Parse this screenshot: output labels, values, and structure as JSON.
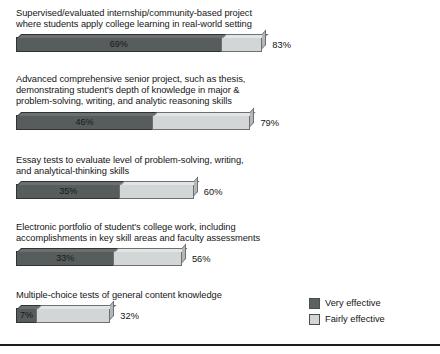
{
  "chart_data": {
    "type": "bar",
    "title": "",
    "subtitle": "",
    "xlabel": "",
    "ylabel": "",
    "orientation": "horizontal",
    "stacked": true,
    "grid": false,
    "xlim": [
      0,
      100
    ],
    "legend_position": "bottom-right",
    "categories": [
      "Supervised/evaluated internship/community-based project where students apply college learning in real-world setting",
      "Advanced comprehensive senior project, such as thesis, demonstrating student's depth of knowledge in major & problem-solving, writing, and analytic reasoning skills",
      "Essay tests to evaluate level of problem-solving, writing, and analytical-thinking skills",
      "Electronic portfolio of student's college work, including accomplishments in key skill areas and faculty assessments",
      "Multiple-choice tests of general content knowledge"
    ],
    "series": [
      {
        "name": "Very effective",
        "color": "#5c6161",
        "values": [
          69,
          46,
          35,
          33,
          7
        ]
      },
      {
        "name": "Fairly effective",
        "color": "#d3d6d6",
        "values": [
          14,
          33,
          25,
          23,
          25
        ]
      }
    ],
    "totals": [
      83,
      79,
      60,
      56,
      32
    ],
    "value_labels": [
      "69%",
      "46%",
      "35%",
      "33%",
      "7%"
    ],
    "total_labels": [
      "83%",
      "79%",
      "60%",
      "56%",
      "32%"
    ]
  },
  "bars": [
    {
      "caption": "Supervised/evaluated internship/community-based project\nwhere students apply college learning in real-world setting",
      "inner_label": "69%",
      "end_label": "83%",
      "very": 69,
      "total": 83
    },
    {
      "caption": "Advanced comprehensive senior project, such as thesis,\ndemonstrating student's depth of knowledge in major &\nproblem-solving, writing, and analytic reasoning skills",
      "inner_label": "46%",
      "end_label": "79%",
      "very": 46,
      "total": 79
    },
    {
      "caption": "Essay tests to evaluate level of problem-solving, writing,\nand analytical-thinking skills",
      "inner_label": "35%",
      "end_label": "60%",
      "very": 35,
      "total": 60
    },
    {
      "caption": "Electronic portfolio of student's college work, including\naccomplishments in key skill areas and faculty assessments",
      "inner_label": "33%",
      "end_label": "56%",
      "very": 33,
      "total": 56
    },
    {
      "caption": "Multiple-choice tests of general content knowledge",
      "inner_label": "7%",
      "end_label": "32%",
      "very": 7,
      "total": 32
    }
  ],
  "legend": {
    "items": [
      {
        "label": "Very effective",
        "color": "#5c6161"
      },
      {
        "label": "Fairly effective",
        "color": "#d3d6d6"
      }
    ]
  },
  "layout": {
    "group_tops": [
      8,
      74,
      155,
      222,
      290
    ],
    "px_per_percent": 2.98,
    "bar_left": 16
  }
}
